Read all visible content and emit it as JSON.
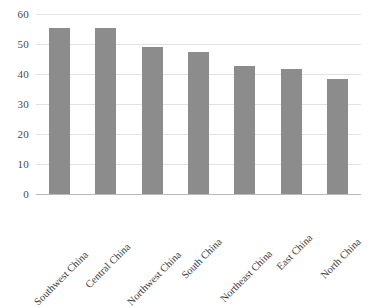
{
  "chart_data": {
    "type": "bar",
    "title": "",
    "subtitle": "",
    "xlabel": "",
    "ylabel": "",
    "categories": [
      "Southwest China",
      "Central China",
      "Northwest China",
      "South China",
      "Northeast China",
      "East China",
      "North China"
    ],
    "values": [
      55.5,
      55.2,
      49.0,
      47.4,
      42.7,
      41.6,
      38.4
    ],
    "ylim": [
      0,
      60
    ],
    "ytick_labels": [
      "0",
      "10",
      "20",
      "30",
      "40",
      "50",
      "60"
    ],
    "ytick_values": [
      0,
      10,
      20,
      30,
      40,
      50,
      60
    ],
    "grid": true,
    "grid_axis": "y",
    "legend": false,
    "legend_position": "none",
    "bar_color": "#8c8c8c",
    "grid_color": "#e2e2e2",
    "axis_color": "#b9b9b9",
    "tick_label_color": "#4a4a4a",
    "category_label_color": "#3d3d3d",
    "background_color": "#ffffff",
    "category_label_rotation": -45
  }
}
